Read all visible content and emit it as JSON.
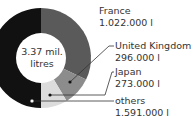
{
  "chart_data": {
    "type": "pie",
    "subtype": "donut",
    "center_label": [
      "3.37 mil.",
      "litres"
    ],
    "categories": [
      "France",
      "United Kingdom",
      "Japan",
      "others"
    ],
    "values": [
      1022000,
      296000,
      273000,
      1591000
    ],
    "value_labels": [
      "1.022.000 l",
      "296.000 l",
      "273.000 l",
      "1.591.000 l"
    ],
    "colors": [
      "#5a5a5a",
      "#8c8c8c",
      "#dcdcdc",
      "#111111"
    ],
    "unit": "litres",
    "legend_position": "right, leader lines"
  },
  "labels": {
    "france": {
      "name": "France",
      "value": "1.022.000 l"
    },
    "uk": {
      "name": "United Kingdom",
      "value": "296.000 l"
    },
    "japan": {
      "name": "Japan",
      "value": "273.000 l"
    },
    "others": {
      "name": "others",
      "value": "1.591.000 l"
    }
  },
  "center": {
    "line1": "3.37 mil.",
    "line2": "litres"
  }
}
